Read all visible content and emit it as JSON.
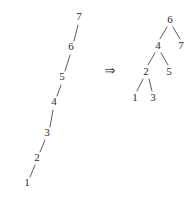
{
  "figure": {
    "background_color": "#ffffff",
    "ink_color": "#2b2b2b",
    "edge_color": "#4a4a4a"
  },
  "transform_operator": {
    "symbol": "⇒",
    "name": "double-right-arrow",
    "x": 110,
    "y": 71
  },
  "left_structure": {
    "name": "degenerate-chain",
    "description": "right-leaning linear chain from 1 at bottom-left up to 7 at top-right",
    "nodes": [
      {
        "label": "1",
        "x": 27,
        "y": 183
      },
      {
        "label": "2",
        "x": 37,
        "y": 158
      },
      {
        "label": "3",
        "x": 47,
        "y": 133
      },
      {
        "label": "4",
        "x": 54,
        "y": 102
      },
      {
        "label": "5",
        "x": 62,
        "y": 77
      },
      {
        "label": "6",
        "x": 71,
        "y": 47
      },
      {
        "label": "7",
        "x": 79,
        "y": 17
      }
    ],
    "edges": [
      {
        "from": "1",
        "to": "2",
        "x1": 30,
        "y1": 177,
        "x2": 35,
        "y2": 165
      },
      {
        "from": "2",
        "to": "3",
        "x1": 40,
        "y1": 152,
        "x2": 45,
        "y2": 140
      },
      {
        "from": "3",
        "to": "4",
        "x1": 50,
        "y1": 127,
        "x2": 53,
        "y2": 110
      },
      {
        "from": "4",
        "to": "5",
        "x1": 57,
        "y1": 96,
        "x2": 61,
        "y2": 85
      },
      {
        "from": "5",
        "to": "6",
        "x1": 65,
        "y1": 71,
        "x2": 70,
        "y2": 55
      },
      {
        "from": "6",
        "to": "7",
        "x1": 74,
        "y1": 41,
        "x2": 78,
        "y2": 25
      }
    ]
  },
  "right_structure": {
    "name": "balanced-tree",
    "description": "rebalanced binary tree rooted at 6",
    "nodes": [
      {
        "label": "6",
        "x": 170,
        "y": 20,
        "role": "root"
      },
      {
        "label": "4",
        "x": 158,
        "y": 46,
        "role": "left-child-of-6"
      },
      {
        "label": "7",
        "x": 181,
        "y": 46,
        "role": "right-child-of-6"
      },
      {
        "label": "2",
        "x": 146,
        "y": 72,
        "role": "left-child-of-4"
      },
      {
        "label": "5",
        "x": 169,
        "y": 72,
        "role": "right-child-of-4"
      },
      {
        "label": "1",
        "x": 135,
        "y": 98,
        "role": "left-child-of-2"
      },
      {
        "label": "3",
        "x": 153,
        "y": 98,
        "role": "right-child-of-2"
      }
    ],
    "edges": [
      {
        "from": "6",
        "to": "4",
        "x1": 167,
        "y1": 27,
        "x2": 160,
        "y2": 39
      },
      {
        "from": "6",
        "to": "7",
        "x1": 173,
        "y1": 27,
        "x2": 180,
        "y2": 39
      },
      {
        "from": "4",
        "to": "2",
        "x1": 155,
        "y1": 53,
        "x2": 148,
        "y2": 65
      },
      {
        "from": "4",
        "to": "5",
        "x1": 161,
        "y1": 53,
        "x2": 168,
        "y2": 65
      },
      {
        "from": "2",
        "to": "1",
        "x1": 143,
        "y1": 79,
        "x2": 137,
        "y2": 91
      },
      {
        "from": "2",
        "to": "3",
        "x1": 149,
        "y1": 79,
        "x2": 152,
        "y2": 91
      }
    ]
  }
}
